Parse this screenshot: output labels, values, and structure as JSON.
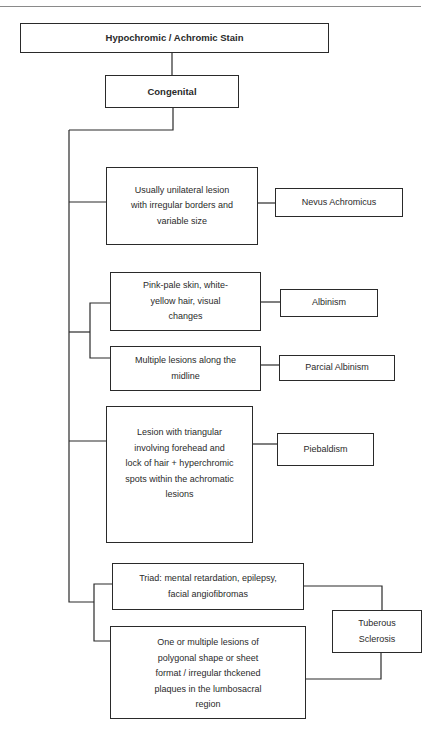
{
  "diagram": {
    "root": {
      "label": "Hypochromic / Achromic Stain"
    },
    "category": {
      "label": "Congenital"
    },
    "branches": [
      {
        "conditions": [
          "Usually unilateral lesion with irregular borders and variable size"
        ],
        "diagnosis": "Nevus Achromicus"
      },
      {
        "conditions": [
          "Pink-pale skin, white-yellow hair, visual changes"
        ],
        "diagnosis": "Albinism"
      },
      {
        "conditions": [
          "Multiple lesions along the midline"
        ],
        "diagnosis": "Parcial Albinism"
      },
      {
        "conditions": [
          "Lesion with triangular involving forehead and lock of hair + hyperchromic spots within the achromatic lesions"
        ],
        "diagnosis": "Piebaldism"
      },
      {
        "conditions": [
          "Triad: mental retardation, epilepsy, facial angiofibromas",
          "One or multiple lesions of polygonal shape or sheet format / irregular thckened plaques in the lumbosacral region"
        ],
        "diagnosis": "Tuberous Sclerosis"
      }
    ]
  }
}
